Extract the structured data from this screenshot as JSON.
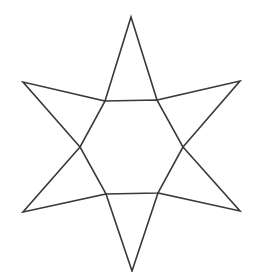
{
  "diagram": {
    "title": "",
    "shape": "six-pointed star",
    "stroke_color": "#3a3a3a",
    "fill_color": "#ffffff",
    "stroke_width": 1.6,
    "outline_points": [
      [
        131,
        17
      ],
      [
        157,
        100
      ],
      [
        240,
        81
      ],
      [
        183,
        147
      ],
      [
        240,
        211
      ],
      [
        158,
        193
      ],
      [
        132,
        271
      ],
      [
        106,
        194
      ],
      [
        23,
        212
      ],
      [
        80,
        147
      ],
      [
        23,
        82
      ],
      [
        105,
        101
      ]
    ],
    "inner_hexagon": [
      [
        105,
        101
      ],
      [
        157,
        100
      ],
      [
        183,
        147
      ],
      [
        158,
        193
      ],
      [
        106,
        194
      ],
      [
        80,
        147
      ]
    ]
  }
}
